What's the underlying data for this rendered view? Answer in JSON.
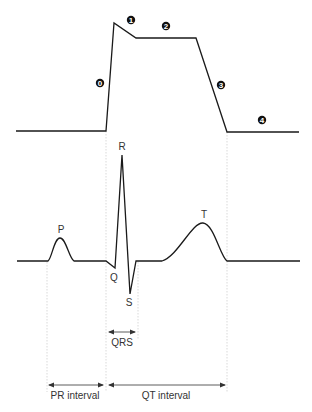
{
  "diagram": {
    "action_potential": {
      "phases": [
        "0",
        "1",
        "2",
        "3",
        "4"
      ]
    },
    "ecg": {
      "waves": {
        "p": "P",
        "q": "Q",
        "r": "R",
        "s": "S",
        "t": "T"
      }
    },
    "intervals": {
      "qrs": "QRS",
      "pr": "PR interval",
      "qt": "QT interval"
    },
    "colors": {
      "line": "#1a1a1a",
      "guide": "#cccccc",
      "text": "#333333"
    }
  }
}
